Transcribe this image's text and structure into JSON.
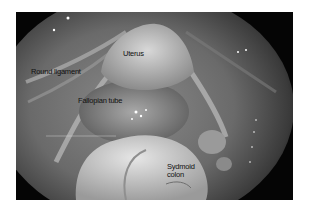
{
  "figure": {
    "type": "laparoscopic photograph",
    "labels": {
      "uterus": "Uterus",
      "round_ligament": "Round ligament",
      "fallopian_tube": "Fallopian tube",
      "colon_line1": "Sydmoid",
      "colon_line2": "colon"
    }
  }
}
